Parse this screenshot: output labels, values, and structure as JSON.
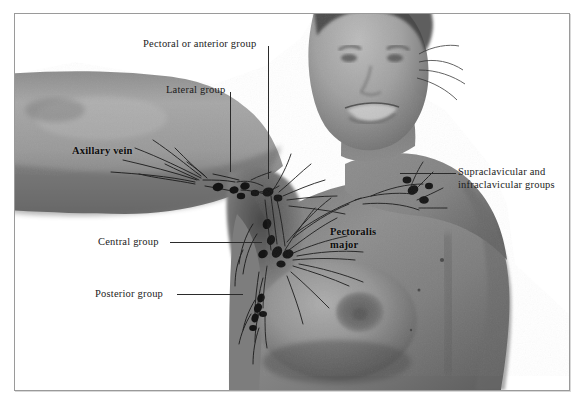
{
  "figure": {
    "frame_color": "#9a9a9a",
    "background": "#ffffff"
  },
  "labels": [
    {
      "id": "pectoral-anterior-group",
      "text": "Pectoral or anterior group",
      "style": "callout",
      "x": 143,
      "y": 38,
      "leader": {
        "type": "vertical",
        "x": 268,
        "y1": 46,
        "y2": 179
      }
    },
    {
      "id": "lateral-group",
      "text": "Lateral group",
      "style": "callout",
      "x": 166,
      "y": 84,
      "leader": {
        "type": "vertical",
        "x": 230,
        "y1": 92,
        "y2": 172
      }
    },
    {
      "id": "axillary-vein",
      "text": "Axillary vein",
      "style": "on-skin",
      "x": 72,
      "y": 145,
      "leader": null
    },
    {
      "id": "supraclavicular-infraclavicular-groups",
      "text": "Supraclavicular and",
      "text_line2": "infraclavicular groups",
      "style": "callout",
      "x": 458,
      "y": 166,
      "leader": {
        "type": "horizontal",
        "y": 173,
        "x1": 400,
        "x2": 456
      }
    },
    {
      "id": "central-group",
      "text": "Central group",
      "style": "callout",
      "x": 98,
      "y": 236,
      "leader": {
        "type": "horizontal",
        "y": 242,
        "x1": 170,
        "x2": 262
      }
    },
    {
      "id": "pectoralis-major",
      "text": "Pectoralis",
      "text_line2": "major",
      "style": "on-skin",
      "x": 330,
      "y": 226,
      "leader": null
    },
    {
      "id": "posterior-group",
      "text": "Posterior group",
      "style": "callout",
      "x": 95,
      "y": 288,
      "leader": {
        "type": "horizontal",
        "y": 294,
        "x1": 177,
        "x2": 243
      }
    }
  ],
  "anatomy": {
    "subject": "smiling adult torso, left arm abducted, grayscale photograph",
    "node_groups": [
      "lateral group",
      "pectoral or anterior group",
      "central group",
      "posterior group",
      "supraclavicular and infraclavicular groups"
    ],
    "structures": [
      "axillary vein",
      "pectoralis major",
      "breast",
      "areola"
    ]
  }
}
